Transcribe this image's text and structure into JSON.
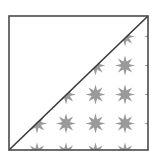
{
  "diagram": {
    "square": {
      "x": 9,
      "y": 16,
      "width": 139,
      "height": 134
    },
    "colors": {
      "background": "#ffffff",
      "border": "#4a4a4a",
      "diagonal": "#3a3a3a",
      "star_fill": "#9a9a9a"
    },
    "stars": {
      "shape": "8-point-star",
      "outer_radius": 10,
      "inner_radius": 4.2,
      "columns_x": [
        37,
        66,
        95.5,
        125,
        154
      ],
      "rows_y": [
        7,
        36.5,
        65.5,
        94.5,
        123.5,
        152.5
      ],
      "region": "lower-right-triangle"
    }
  }
}
